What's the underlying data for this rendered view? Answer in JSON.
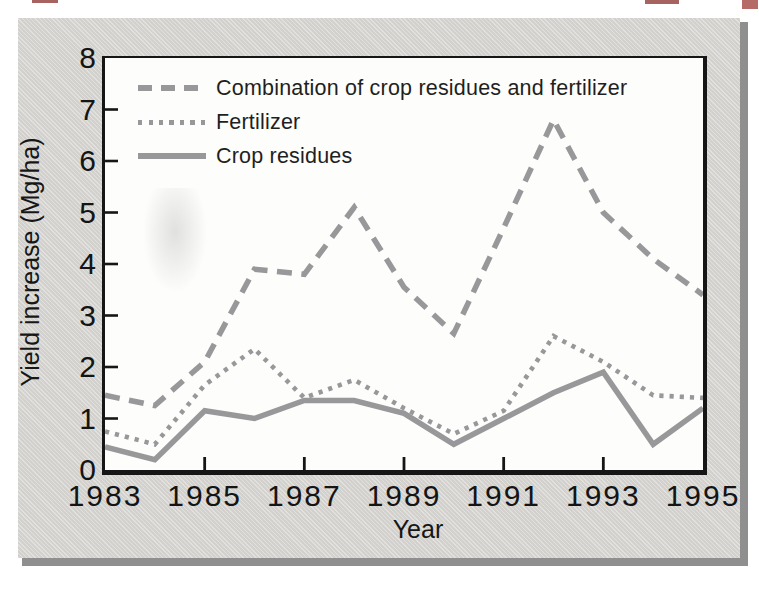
{
  "figure": {
    "panel_bg": "#d6d5d1",
    "panel_shadow": "#8f8f8f",
    "plot_bg": "#fdfdfb",
    "axis_color": "#161616",
    "text_color": "#1f1f1f",
    "artifact_color": "#8a2f2b"
  },
  "chart_data": {
    "type": "line",
    "title": "",
    "xlabel": "Year",
    "ylabel": "Yield increase (Mg/ha)",
    "line_color": "#98989a",
    "x": [
      1983,
      1984,
      1985,
      1986,
      1987,
      1988,
      1989,
      1990,
      1991,
      1992,
      1993,
      1994,
      1995
    ],
    "xlim": [
      1983,
      1995
    ],
    "ylim": [
      0,
      8
    ],
    "yticks": [
      0,
      1,
      2,
      3,
      4,
      5,
      6,
      7,
      8
    ],
    "ytick_marks": [
      1,
      2,
      3,
      4,
      5,
      6,
      7
    ],
    "xtick_labels": [
      1983,
      1985,
      1987,
      1989,
      1991,
      1993,
      1995
    ],
    "xtick_marks": [
      1985,
      1987,
      1989,
      1991,
      1993
    ],
    "grid": false,
    "legend_position": "upper-left-inside",
    "series": [
      {
        "name": "Combination of crop residues and fertilizer",
        "style": "dashed",
        "values": [
          1.45,
          1.25,
          2.1,
          3.9,
          3.8,
          5.1,
          3.55,
          2.65,
          4.7,
          6.8,
          5.0,
          4.1,
          3.4
        ]
      },
      {
        "name": "Fertilizer",
        "style": "dotted",
        "values": [
          0.75,
          0.5,
          1.65,
          2.35,
          1.4,
          1.75,
          1.2,
          0.7,
          1.15,
          2.6,
          2.1,
          1.45,
          1.4
        ]
      },
      {
        "name": "Crop residues",
        "style": "solid",
        "values": [
          0.45,
          0.2,
          1.15,
          1.0,
          1.35,
          1.35,
          1.1,
          0.5,
          1.0,
          1.5,
          1.9,
          0.5,
          1.2
        ]
      }
    ]
  }
}
